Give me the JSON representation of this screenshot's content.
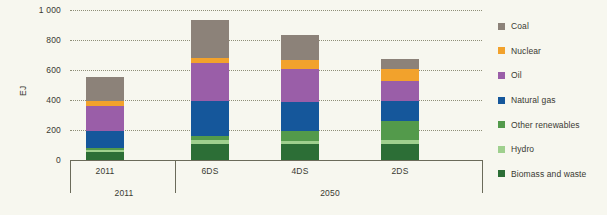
{
  "chart_data": {
    "type": "bar",
    "subtype": "stacked",
    "title": "",
    "xlabel": "",
    "ylabel": "EJ",
    "ylim": [
      0,
      1000
    ],
    "yticks": [
      0,
      200,
      400,
      600,
      800,
      1000
    ],
    "ytick_labels": [
      "0",
      "200",
      "400",
      "600",
      "800",
      "1 000"
    ],
    "grid": true,
    "legend_position": "right",
    "categories": [
      "2011",
      "6DS",
      "4DS",
      "2DS"
    ],
    "group_labels": [
      {
        "label": "2011",
        "categories": [
          "2011"
        ]
      },
      {
        "label": "2050",
        "categories": [
          "6DS",
          "4DS",
          "2DS"
        ]
      }
    ],
    "series": [
      {
        "name": "Biomass and waste",
        "color": "#2c6e36",
        "values": [
          55,
          110,
          105,
          105
        ]
      },
      {
        "name": "Hydro",
        "color": "#9fd08e",
        "values": [
          13,
          25,
          25,
          30
        ]
      },
      {
        "name": "Other renewables",
        "color": "#539a4b",
        "values": [
          10,
          25,
          65,
          125
        ]
      },
      {
        "name": "Natural gas",
        "color": "#15579b",
        "values": [
          115,
          235,
          195,
          135
        ]
      },
      {
        "name": "Oil",
        "color": "#9a5ea8",
        "values": [
          170,
          250,
          220,
          130
        ]
      },
      {
        "name": "Nuclear",
        "color": "#f2a22c",
        "values": [
          30,
          35,
          55,
          85
        ]
      },
      {
        "name": "Coal",
        "color": "#8c8279",
        "values": [
          160,
          255,
          170,
          65
        ]
      }
    ],
    "totals": [
      553,
      935,
      835,
      675
    ]
  },
  "legend": {
    "items": [
      {
        "label": "Coal",
        "color": "#8c8279"
      },
      {
        "label": "Nuclear",
        "color": "#f2a22c"
      },
      {
        "label": "Oil",
        "color": "#9a5ea8"
      },
      {
        "label": "Natural gas",
        "color": "#15579b"
      },
      {
        "label": "Other renewables",
        "color": "#539a4b"
      },
      {
        "label": "Hydro",
        "color": "#9fd08e"
      },
      {
        "label": "Biomass and waste",
        "color": "#2c6e36"
      }
    ]
  },
  "axis": {
    "y_title": "EJ"
  }
}
